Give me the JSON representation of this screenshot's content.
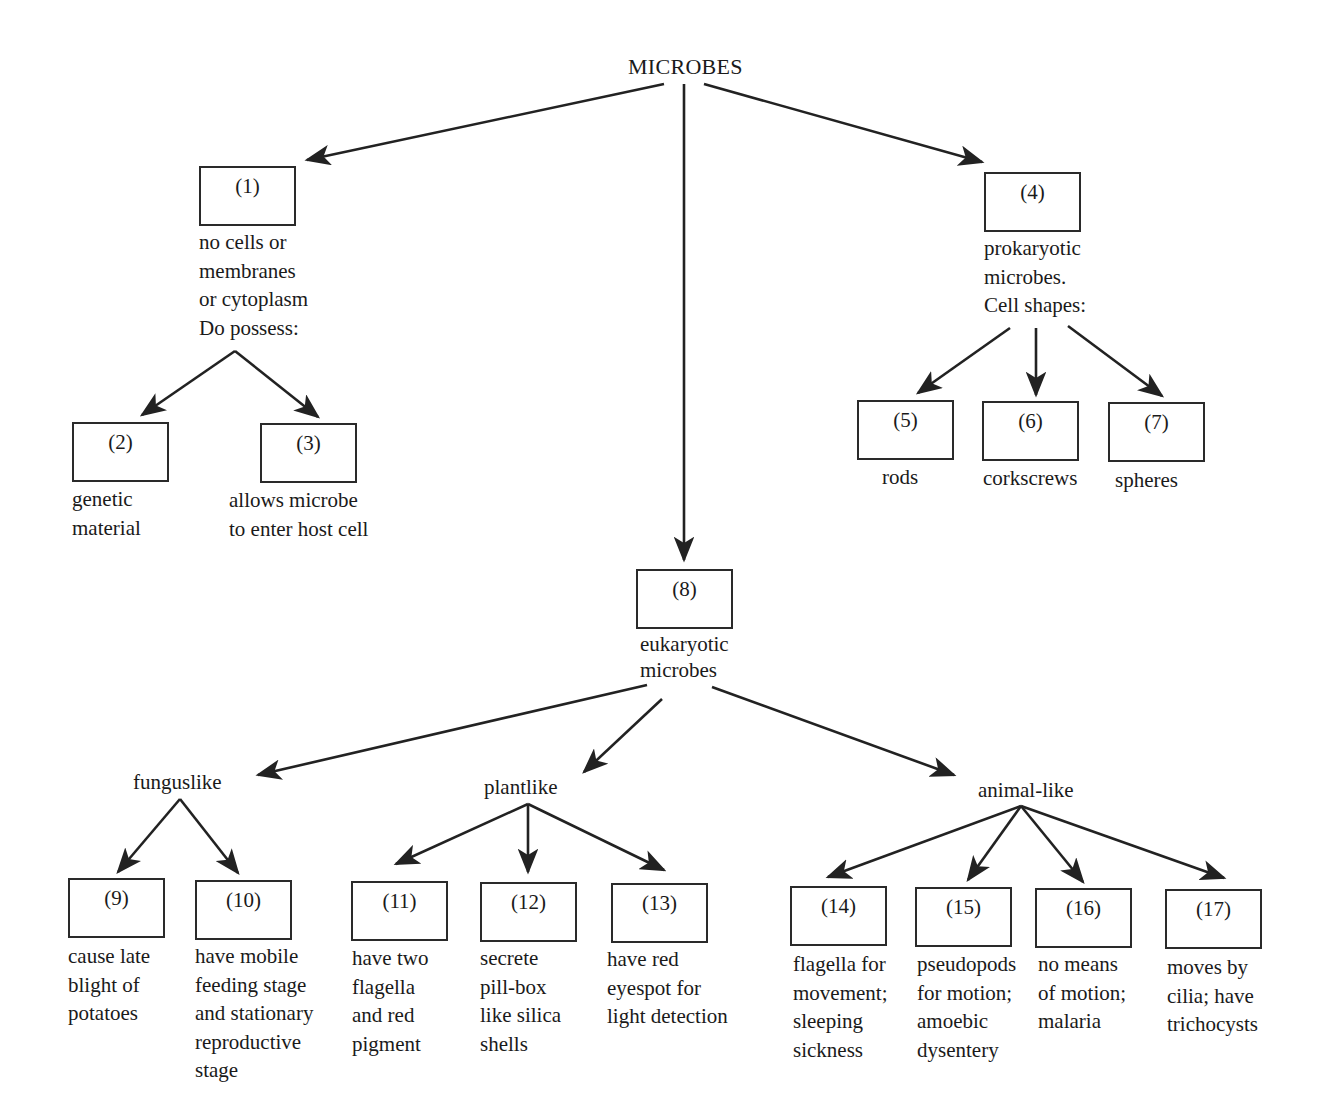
{
  "title": "MICROBES",
  "nodes": {
    "n1": {
      "num": "(1)",
      "lines": [
        "no cells or",
        "membranes",
        "or cytoplasm",
        "Do possess:"
      ]
    },
    "n2": {
      "num": "(2)",
      "lines": [
        "genetic",
        "material"
      ]
    },
    "n3": {
      "num": "(3)",
      "lines": [
        "allows microbe",
        "to enter host cell"
      ]
    },
    "n4": {
      "num": "(4)",
      "lines": [
        "prokaryotic",
        "microbes.",
        "Cell shapes:"
      ]
    },
    "n5": {
      "num": "(5)",
      "lines": [
        "rods"
      ]
    },
    "n6": {
      "num": "(6)",
      "lines": [
        "corkscrews"
      ]
    },
    "n7": {
      "num": "(7)",
      "lines": [
        "spheres"
      ]
    },
    "n8": {
      "num": "(8)",
      "lines": [
        "eukaryotic",
        "microbes"
      ]
    },
    "n9": {
      "num": "(9)",
      "lines": [
        "cause late",
        "blight of",
        "potatoes"
      ]
    },
    "n10": {
      "num": "(10)",
      "lines": [
        "have mobile",
        "feeding stage",
        "and stationary",
        "reproductive",
        "stage"
      ]
    },
    "n11": {
      "num": "(11)",
      "lines": [
        "have two",
        "flagella",
        "and red",
        "pigment"
      ]
    },
    "n12": {
      "num": "(12)",
      "lines": [
        "secrete",
        "pill-box",
        "like silica",
        "shells"
      ]
    },
    "n13": {
      "num": "(13)",
      "lines": [
        "have red",
        "eyespot for",
        "light detection"
      ]
    },
    "n14": {
      "num": "(14)",
      "lines": [
        "flagella for",
        "movement;",
        "sleeping",
        "sickness"
      ]
    },
    "n15": {
      "num": "(15)",
      "lines": [
        "pseudopods",
        "for motion;",
        "amoebic",
        "dysentery"
      ]
    },
    "n16": {
      "num": "(16)",
      "lines": [
        "no means",
        "of motion;",
        "malaria"
      ]
    },
    "n17": {
      "num": "(17)",
      "lines": [
        "moves by",
        "cilia; have",
        "trichocysts"
      ]
    }
  },
  "categories": {
    "fungus": "funguslike",
    "plant": "plantlike",
    "animal": "animal-like"
  }
}
